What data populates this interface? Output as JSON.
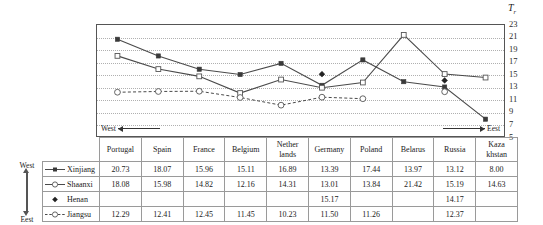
{
  "chart_data": {
    "type": "line",
    "title": "",
    "xlabel": "",
    "ylabel": "T",
    "ylabel_sub": "r",
    "ylim": [
      5,
      23
    ],
    "yticks": [
      23,
      21,
      19,
      17,
      15,
      13,
      11,
      9,
      7,
      5
    ],
    "grid": true,
    "legend_position": "table-left",
    "categories": [
      "Portugal",
      "Spain",
      "France",
      "Belgium",
      "Nether lands",
      "Germany",
      "Poland",
      "Belarus",
      "Russia",
      "Kaza khstan"
    ],
    "direction_left": "West",
    "direction_right": "Eest",
    "series": [
      {
        "name": "Xinjiang",
        "marker": "filled-square",
        "line": "solid",
        "values": [
          20.73,
          18.07,
          15.96,
          15.11,
          16.89,
          13.39,
          17.44,
          13.97,
          13.12,
          8.0
        ]
      },
      {
        "name": "Shaanxi",
        "marker": "open-square",
        "line": "solid",
        "values": [
          18.08,
          15.98,
          14.82,
          12.16,
          14.31,
          13.01,
          13.84,
          21.42,
          15.19,
          14.63
        ]
      },
      {
        "name": "Henan",
        "marker": "filled-diamond",
        "line": "none",
        "values": [
          null,
          null,
          null,
          null,
          null,
          15.17,
          null,
          null,
          14.17,
          null
        ]
      },
      {
        "name": "Jiangsu",
        "marker": "open-circle",
        "line": "dashed",
        "values": [
          12.29,
          12.41,
          12.45,
          11.45,
          10.23,
          11.5,
          11.26,
          null,
          12.37,
          null
        ]
      }
    ]
  },
  "table": {
    "headers": [
      "Portugal",
      "Spain",
      "France",
      "Belgium",
      "Nether lands",
      "Germany",
      "Poland",
      "Belarus",
      "Russia",
      "Kaza khstan"
    ],
    "rows": [
      {
        "label": "Xinjiang",
        "cells": [
          "20.73",
          "18.07",
          "15.96",
          "15.11",
          "16.89",
          "13.39",
          "17.44",
          "13.97",
          "13.12",
          "8.00"
        ]
      },
      {
        "label": "Shaanxi",
        "cells": [
          "18.08",
          "15.98",
          "14.82",
          "12.16",
          "14.31",
          "13.01",
          "13.84",
          "21.42",
          "15.19",
          "14.63"
        ]
      },
      {
        "label": "Henan",
        "cells": [
          "",
          "",
          "",
          "",
          "",
          "15.17",
          "",
          "",
          "14.17",
          ""
        ]
      },
      {
        "label": "Jiangsu",
        "cells": [
          "12.29",
          "12.41",
          "12.45",
          "11.45",
          "10.23",
          "11.50",
          "11.26",
          "",
          "12.37",
          ""
        ]
      }
    ]
  },
  "side_axis": {
    "top_label": "West",
    "bottom_label": "Eest"
  },
  "colors": {
    "line": "#4a4a4a",
    "grid": "#b0b0b0",
    "border": "#555555",
    "text": "#1a1a1a"
  }
}
